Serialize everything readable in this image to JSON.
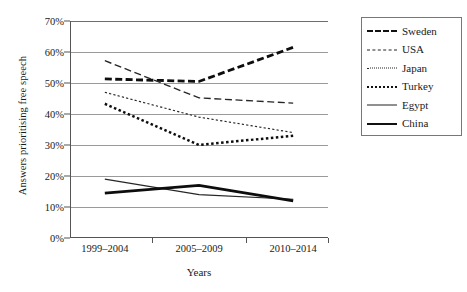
{
  "chart_data": {
    "type": "line",
    "title": "",
    "xlabel": "Years",
    "ylabel": "Answers prioritising free speech",
    "categories": [
      "1999–2004",
      "2005–2009",
      "2010–2014"
    ],
    "ylim": [
      0,
      70
    ],
    "ytick_labels": [
      "0%",
      "10%",
      "20%",
      "30%",
      "40%",
      "50%",
      "60%",
      "70%"
    ],
    "ytick_values": [
      0,
      10,
      20,
      30,
      40,
      50,
      60,
      70
    ],
    "grid": true,
    "legend_position": "right",
    "value_suffix": "%",
    "series": [
      {
        "name": "Sweden",
        "style": "thick-dashed",
        "color": "#0d0d0d",
        "values": [
          51.3,
          50.5,
          61.5
        ]
      },
      {
        "name": "USA",
        "style": "thin-dashed",
        "color": "#262626",
        "values": [
          57.2,
          45.2,
          43.5
        ]
      },
      {
        "name": "Japan",
        "style": "fine-dotted",
        "color": "#262626",
        "values": [
          47.0,
          39.0,
          34.0
        ]
      },
      {
        "name": "Turkey",
        "style": "thick-dotted",
        "color": "#0d0d0d",
        "values": [
          43.3,
          30.0,
          33.0
        ]
      },
      {
        "name": "Egypt",
        "style": "thin-solid",
        "color": "#262626",
        "values": [
          19.0,
          14.0,
          12.5
        ]
      },
      {
        "name": "China",
        "style": "thick-solid",
        "color": "#0d0d0d",
        "values": [
          14.5,
          17.0,
          12.0
        ]
      }
    ]
  },
  "legend": {
    "items": [
      {
        "label": "Sweden"
      },
      {
        "label": "USA"
      },
      {
        "label": "Japan"
      },
      {
        "label": "Turkey"
      },
      {
        "label": "Egypt"
      },
      {
        "label": "China"
      }
    ]
  },
  "axes": {
    "y_title": "Answers prioritising free speech",
    "x_title": "Years"
  }
}
